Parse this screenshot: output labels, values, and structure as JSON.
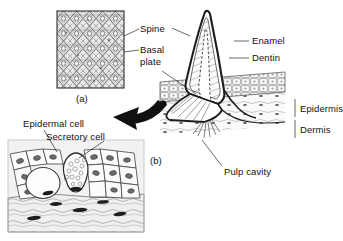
{
  "figure": {
    "caption_a": "(a)",
    "caption_b": "(b)",
    "background": "#ffffff",
    "ink": "#1a1a1a"
  },
  "labels": {
    "spine": "Spine",
    "basal_plate_l1": "Basal",
    "basal_plate_l2": "plate",
    "enamel": "Enamel",
    "dentin": "Dentin",
    "epidermis": "Epidermis",
    "dermis": "Dermis",
    "pulp_cavity": "Pulp cavity",
    "epidermal_cell": "Epidermal cell",
    "secretory_cell": "Secretory cell"
  },
  "panels": [
    {
      "id": "a",
      "caption": "(a)",
      "description": "Surface view micrograph of placoid scales in diamond lattice",
      "labels": [
        "Spine",
        "Basal plate"
      ]
    },
    {
      "id": "b",
      "caption": "(b)",
      "description": "Sectional view of a placoid scale (denticle) in skin",
      "labels": [
        "Enamel",
        "Dentin",
        "Epidermis",
        "Dermis",
        "Pulp cavity"
      ]
    },
    {
      "id": "c",
      "caption": "",
      "description": "Histological section of epidermis showing cells",
      "labels": [
        "Epidermal cell",
        "Secretory cell"
      ]
    }
  ],
  "icons": {
    "arrow": "curved-arrow-icon"
  }
}
